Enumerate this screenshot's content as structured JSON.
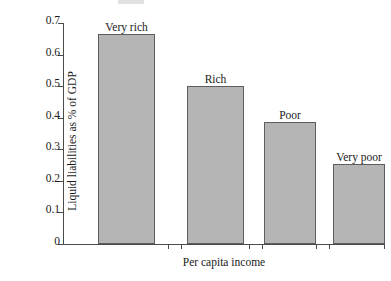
{
  "chart_data": {
    "type": "bar",
    "title": "",
    "categories": [
      "Very rich",
      "Rich",
      "Poor",
      "Very poor"
    ],
    "values": [
      0.665,
      0.5,
      0.385,
      0.255
    ],
    "bar_labels": [
      "Very rich",
      "Rich",
      "Poor",
      "Very poor"
    ],
    "xlabel": "Per capita income",
    "ylabel": "Liquid liabilities as % of GDP",
    "ylim": [
      0,
      0.7
    ],
    "yticks": [
      "0.7",
      "0.6",
      "0.5",
      "0.4",
      "0.3",
      "0.2",
      "0.1",
      "0"
    ],
    "ytick_values": [
      0.7,
      0.6,
      0.5,
      0.4,
      0.3,
      0.2,
      0.1,
      0
    ],
    "xtick_labels": [],
    "grid": false,
    "legend": false,
    "bar_color": "#b5b5b5",
    "bar_edge_color": "#5d5d5d",
    "axis_color": "#4a4a4a",
    "background_color": "#ffffff"
  }
}
